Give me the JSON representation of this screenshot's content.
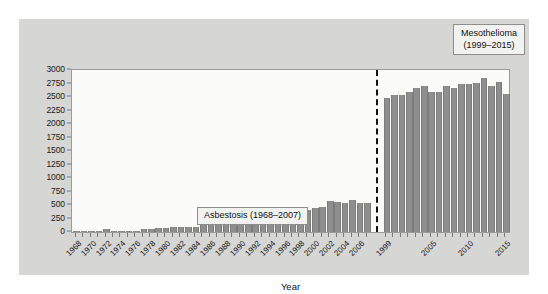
{
  "chart_data": {
    "type": "bar",
    "title": "",
    "xlabel": "Year",
    "ylabel": "",
    "ylim": [
      0,
      3000
    ],
    "ytick_values": [
      0,
      250,
      500,
      750,
      1000,
      1250,
      1500,
      1750,
      2000,
      2250,
      2500,
      2750,
      3000
    ],
    "ytick_labels": [
      "0",
      "250",
      "500",
      "750",
      "1000",
      "1250",
      "1500",
      "1750",
      "2000",
      "2250",
      "2500",
      "2750",
      "3000"
    ],
    "grid": false,
    "legend_position": "inside-annotations",
    "series": [
      {
        "name": "Asbestosis",
        "range_label": "Asbestosis (1968–2007)",
        "years": [
          1968,
          1969,
          1970,
          1971,
          1972,
          1973,
          1974,
          1975,
          1976,
          1977,
          1978,
          1979,
          1980,
          1981,
          1982,
          1983,
          1984,
          1985,
          1986,
          1987,
          1988,
          1989,
          1990,
          1991,
          1992,
          1993,
          1994,
          1995,
          1996,
          1997,
          1998,
          1999,
          2000,
          2001,
          2002,
          2003,
          2004,
          2005,
          2006,
          2007
        ],
        "values": [
          12,
          14,
          16,
          20,
          55,
          22,
          20,
          22,
          28,
          48,
          52,
          80,
          75,
          90,
          92,
          95,
          100,
          140,
          145,
          170,
          195,
          205,
          210,
          275,
          295,
          265,
          290,
          300,
          320,
          335,
          360,
          410,
          450,
          455,
          570,
          555,
          530,
          585,
          540,
          535
        ],
        "tick_label_years": [
          1968,
          1970,
          1972,
          1974,
          1976,
          1978,
          1980,
          1982,
          1984,
          1986,
          1988,
          1990,
          1992,
          1994,
          1996,
          1998,
          2000,
          2002,
          2004,
          2006
        ]
      },
      {
        "name": "Mesothelioma",
        "range_label": "Mesothelioma (1999–2015)",
        "years": [
          1999,
          2000,
          2001,
          2002,
          2003,
          2004,
          2005,
          2006,
          2007,
          2008,
          2009,
          2010,
          2011,
          2012,
          2013,
          2014,
          2015
        ],
        "values": [
          2485,
          2530,
          2545,
          2600,
          2660,
          2700,
          2595,
          2600,
          2710,
          2675,
          2740,
          2750,
          2755,
          2845,
          2700,
          2775,
          2560
        ],
        "tick_label_years": [
          1999,
          2005,
          2010,
          2015
        ]
      }
    ],
    "divider": {
      "style": "dashed",
      "color": "#111111",
      "between": [
        "Asbestosis",
        "Mesothelioma"
      ]
    },
    "colors": {
      "bar": "#8e8e8e",
      "panel_background": "#d6d6d4",
      "plot_background": "#fbfbfa",
      "axis": "#9a9a9a",
      "text": "#1a1a1a",
      "callout_background": "#f2f2f0",
      "callout_border": "#8d8d8d"
    }
  },
  "annotations": {
    "asbestosis_label": "Asbestosis (1968–2007)",
    "mesothelioma_label_line1": "Mesothelioma",
    "mesothelioma_label_line2": "(1999–2015)"
  },
  "axis": {
    "x_title": "Year"
  }
}
